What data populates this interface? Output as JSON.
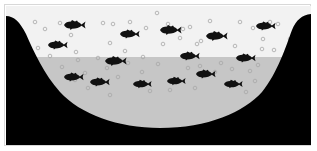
{
  "illustration": {
    "description": "Lake cross-section with fish and bubbles",
    "colors": {
      "background": "#ffffff",
      "upper_water": "#f2f2f2",
      "lower_water": "#c6c6c6",
      "land": "#000000",
      "fish": "#111111",
      "bubble_stroke": "#a8a8a8",
      "frame_border": "#d8d8d8"
    },
    "water_line_y": 57,
    "fish": [
      {
        "x": 64,
        "y": 25,
        "w": 22
      },
      {
        "x": 120,
        "y": 34,
        "w": 20
      },
      {
        "x": 48,
        "y": 45,
        "w": 20
      },
      {
        "x": 160,
        "y": 30,
        "w": 22
      },
      {
        "x": 206,
        "y": 36,
        "w": 22
      },
      {
        "x": 256,
        "y": 26,
        "w": 20
      },
      {
        "x": 105,
        "y": 61,
        "w": 22
      },
      {
        "x": 180,
        "y": 56,
        "w": 20
      },
      {
        "x": 236,
        "y": 58,
        "w": 20
      },
      {
        "x": 196,
        "y": 74,
        "w": 20
      },
      {
        "x": 64,
        "y": 77,
        "w": 20
      },
      {
        "x": 90,
        "y": 82,
        "w": 20
      },
      {
        "x": 133,
        "y": 84,
        "w": 19
      },
      {
        "x": 167,
        "y": 81,
        "w": 19
      },
      {
        "x": 224,
        "y": 84,
        "w": 19
      }
    ],
    "bubbles": [
      [
        35,
        22
      ],
      [
        45,
        29
      ],
      [
        60,
        23
      ],
      [
        71,
        35
      ],
      [
        76,
        52
      ],
      [
        103,
        23
      ],
      [
        110,
        43
      ],
      [
        113,
        24
      ],
      [
        125,
        51
      ],
      [
        130,
        22
      ],
      [
        146,
        28
      ],
      [
        157,
        13
      ],
      [
        163,
        44
      ],
      [
        168,
        24
      ],
      [
        180,
        38
      ],
      [
        183,
        29
      ],
      [
        190,
        27
      ],
      [
        197,
        44
      ],
      [
        201,
        41
      ],
      [
        210,
        21
      ],
      [
        235,
        46
      ],
      [
        240,
        22
      ],
      [
        253,
        28
      ],
      [
        263,
        39
      ],
      [
        270,
        22
      ],
      [
        278,
        24
      ],
      [
        290,
        39
      ],
      [
        262,
        49
      ],
      [
        274,
        50
      ],
      [
        38,
        48
      ],
      [
        50,
        56
      ],
      [
        62,
        67
      ],
      [
        75,
        80
      ],
      [
        85,
        73
      ],
      [
        98,
        58
      ],
      [
        107,
        68
      ],
      [
        118,
        77
      ],
      [
        128,
        63
      ],
      [
        142,
        72
      ],
      [
        150,
        91
      ],
      [
        158,
        64
      ],
      [
        170,
        90
      ],
      [
        188,
        68
      ],
      [
        200,
        66
      ],
      [
        215,
        72
      ],
      [
        221,
        63
      ],
      [
        232,
        69
      ],
      [
        250,
        71
      ],
      [
        255,
        81
      ],
      [
        258,
        65
      ],
      [
        246,
        92
      ],
      [
        195,
        88
      ],
      [
        88,
        88
      ],
      [
        110,
        95
      ],
      [
        78,
        60
      ],
      [
        143,
        57
      ]
    ]
  }
}
